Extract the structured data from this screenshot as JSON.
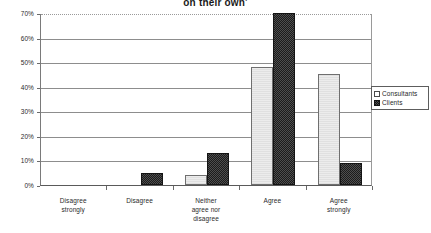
{
  "chart_data": {
    "type": "bar",
    "title": "on their own'",
    "title_note": "title is cropped at the top edge of the screenshot; only final line visible",
    "xlabel": "",
    "ylabel": "",
    "ylim": [
      0,
      70
    ],
    "ytick_labels": [
      "0%",
      "10%",
      "20%",
      "30%",
      "40%",
      "50%",
      "60%",
      "70%"
    ],
    "ytick_values": [
      0,
      10,
      20,
      30,
      40,
      50,
      60,
      70
    ],
    "grid": true,
    "legend_position": "right",
    "categories": [
      "Disagree strongly",
      "Disagree",
      "Neither agree nor disagree",
      "Agree",
      "Agree strongly"
    ],
    "category_lines": [
      [
        "Disagree",
        "strongly"
      ],
      [
        "Disagree"
      ],
      [
        "Neither",
        "agree nor",
        "disagree"
      ],
      [
        "Agree"
      ],
      [
        "Agree",
        "strongly"
      ]
    ],
    "series": [
      {
        "name": "Consultants",
        "color": "#ececec",
        "values": [
          0,
          0,
          4,
          48,
          45
        ]
      },
      {
        "name": "Clients",
        "color": "#2e2e2e",
        "values": [
          0,
          5,
          13,
          70,
          9
        ]
      }
    ]
  },
  "legend": {
    "items": [
      {
        "label": "Consultants",
        "swatch": "light-swatch-icon"
      },
      {
        "label": "Clients",
        "swatch": "dark-swatch-icon"
      }
    ]
  }
}
